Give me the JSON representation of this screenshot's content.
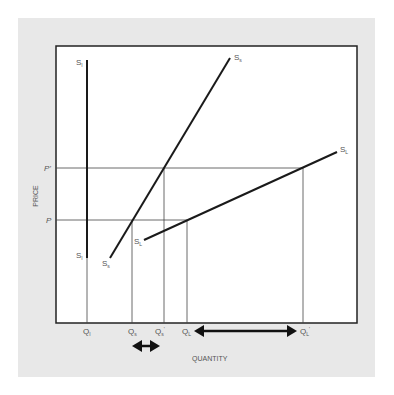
{
  "figure": {
    "background_color": "#e8e8e8",
    "plot_background": "#ffffff",
    "line_color": "#1a1a1a",
    "guide_color": "#444444"
  },
  "axes": {
    "x_label": "QUANTITY",
    "y_label": "PRICE"
  },
  "price_levels": {
    "p": "P",
    "p_prime": "P'"
  },
  "curves": {
    "s_i_top": {
      "main": "S",
      "sub": "I"
    },
    "s_i_bottom": {
      "main": "S",
      "sub": "I"
    },
    "s_s_top": {
      "main": "S",
      "sub": "s"
    },
    "s_s_bottom": {
      "main": "S",
      "sub": "s"
    },
    "s_l_top": {
      "main": "S",
      "sub": "L"
    },
    "s_l_bottom": {
      "main": "S",
      "sub": "L"
    }
  },
  "quantity_ticks": [
    {
      "id": "q_i",
      "main": "Q",
      "sub": "I",
      "prime": ""
    },
    {
      "id": "q_s",
      "main": "Q",
      "sub": "s",
      "prime": ""
    },
    {
      "id": "q_s_prime",
      "main": "Q",
      "sub": "s",
      "prime": "'"
    },
    {
      "id": "q_l",
      "main": "Q",
      "sub": "L",
      "prime": ""
    },
    {
      "id": "q_l_prime",
      "main": "Q",
      "sub": "L",
      "prime": "'"
    }
  ],
  "annotations": {
    "short_run_change": "Q_s to Q_s'",
    "long_run_change": "Q_L to Q_L'"
  }
}
